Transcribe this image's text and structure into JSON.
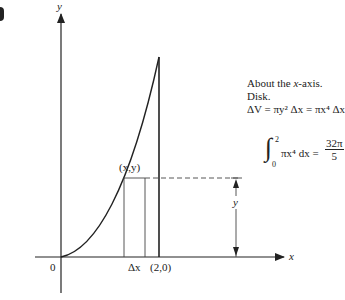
{
  "figure": {
    "corner_mark": "partial label",
    "axes": {
      "x_label": "x",
      "y_label": "y",
      "origin_label": "0"
    },
    "points": {
      "curve_point": "(x,y)",
      "endpoint": "(2,0)"
    },
    "strip": {
      "width_label": "Δx",
      "height_label": "y"
    },
    "annotation": {
      "line1": "About the x-axis.",
      "line1_pre": "About the ",
      "line1_var": "x",
      "line1_post": "-axis.",
      "line2": "Disk.",
      "line3": "ΔV = πy² Δx = πx⁴ Δx"
    },
    "integral": {
      "sign": "∫",
      "upper": "2",
      "lower": "0",
      "integrand": "πx⁴ dx =",
      "result_numerator": "32π",
      "result_denominator": "5"
    },
    "curve": {
      "equation": "y = x^2",
      "domain": [
        0,
        2
      ]
    },
    "colors": {
      "ink": "#222222",
      "background": "#ffffff"
    }
  }
}
